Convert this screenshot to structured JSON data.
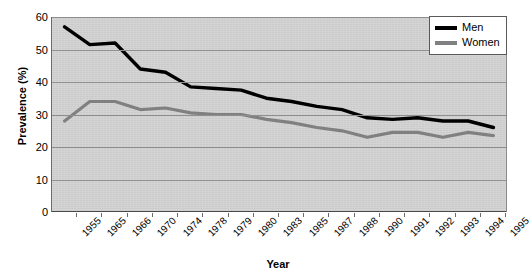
{
  "chart": {
    "ylabel": "Prevalence (%)",
    "xlabel": "Year",
    "legend": {
      "men_label": "Men",
      "women_label": "Women",
      "men_color": "#000000",
      "women_color": "#808080"
    },
    "yticks": [
      "0",
      "10",
      "20",
      "30",
      "40",
      "50",
      "60"
    ]
  },
  "chart_data": {
    "type": "line",
    "title": "",
    "xlabel": "Year",
    "ylabel": "Prevalence (%)",
    "categories": [
      "1955",
      "1965",
      "1966",
      "1970",
      "1974",
      "1978",
      "1979",
      "1980",
      "1983",
      "1985",
      "1987",
      "1988",
      "1990",
      "1991",
      "1992",
      "1993",
      "1994",
      "1995"
    ],
    "series": [
      {
        "name": "Men",
        "color": "#000000",
        "values": [
          57,
          51.5,
          52,
          44,
          43,
          38.5,
          38,
          37.5,
          35,
          34,
          32.5,
          31.5,
          29,
          28.5,
          29,
          28,
          28,
          26
        ]
      },
      {
        "name": "Women",
        "color": "#808080",
        "values": [
          28,
          34,
          34,
          31.5,
          32,
          30.5,
          30,
          30,
          28.5,
          27.5,
          26,
          25,
          23,
          24.5,
          24.5,
          23,
          24.5,
          23.5
        ]
      }
    ],
    "ylim": [
      0,
      60
    ],
    "ytick_step": 10,
    "grid": true,
    "legend_position": "top-right",
    "plot_background": "#d2d2d2"
  }
}
